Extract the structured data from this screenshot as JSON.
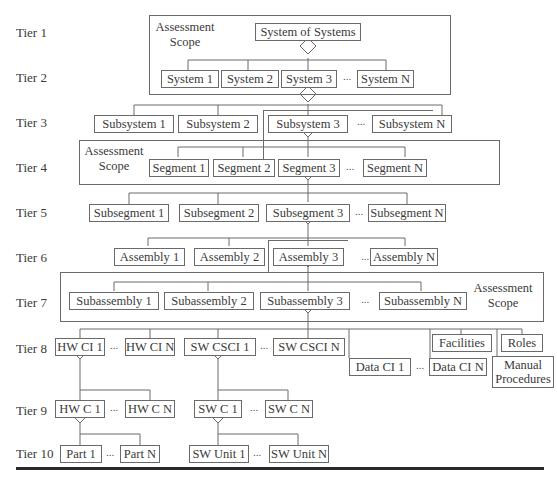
{
  "tiers": [
    "Tier 1",
    "Tier 2",
    "Tier 3",
    "Tier 4",
    "Tier 5",
    "Tier 6",
    "Tier 7",
    "Tier 8",
    "Tier 9",
    "Tier 10"
  ],
  "scope_label": "Assessment Scope",
  "scope_label_lines": [
    "Assessment",
    "Scope"
  ],
  "ellipsis": "...",
  "tier1": {
    "root": "System of Systems"
  },
  "tier2": [
    "System 1",
    "System 2",
    "System 3",
    "System N"
  ],
  "tier3": [
    "Subsystem 1",
    "Subsystem 2",
    "Subsystem 3",
    "Subsystem N"
  ],
  "tier4": [
    "Segment 1",
    "Segment 2",
    "Segment 3",
    "Segment N"
  ],
  "tier5": [
    "Subsegment 1",
    "Subsegment 2",
    "Subsegment 3",
    "Subsegment N"
  ],
  "tier6": [
    "Assembly 1",
    "Assembly 2",
    "Assembly 3",
    "Assembly N"
  ],
  "tier7": [
    "Subassembly 1",
    "Subassembly 2",
    "Subassembly 3",
    "Subassembly N"
  ],
  "tier8": {
    "hw": [
      "HW CI 1",
      "HW CI N"
    ],
    "sw": [
      "SW CSCI 1",
      "SW CSCI N"
    ],
    "data": [
      "Data CI 1",
      "Data CI N"
    ],
    "facilities": "Facilities",
    "roles": "Roles",
    "manual_procedures_lines": [
      "Manual",
      "Procedures"
    ]
  },
  "tier9": {
    "hw": [
      "HW C 1",
      "HW C N"
    ],
    "sw": [
      "SW C 1",
      "SW C N"
    ]
  },
  "tier10": {
    "hw": [
      "Part 1",
      "Part N"
    ],
    "sw": [
      "SW Unit 1",
      "SW Unit N"
    ]
  }
}
